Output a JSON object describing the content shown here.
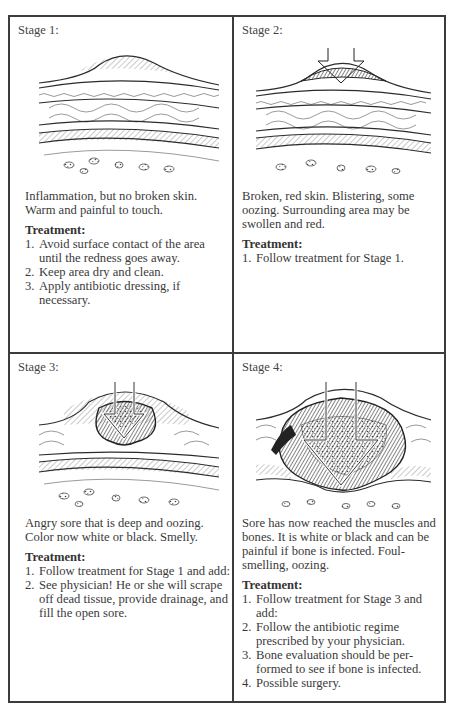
{
  "panels": [
    {
      "title": "Stage 1:",
      "illustration": "skin-cross-section-inflammation",
      "description": "Inflammation, but no broken skin. Warm and painful to touch.",
      "treatment_label": "Treatment:",
      "treatment": [
        {
          "num": "1.",
          "text": "Avoid surface contact of the area until the redness goes away."
        },
        {
          "num": "2.",
          "text": "Keep area dry and clean."
        },
        {
          "num": "3.",
          "text": "Apply antibiotic dressing, if necessary."
        }
      ]
    },
    {
      "title": "Stage 2:",
      "illustration": "skin-cross-section-blistering",
      "description": "Broken, red skin. Blistering, some oozing. Surrounding area may be swollen and red.",
      "treatment_label": "Treatment:",
      "treatment": [
        {
          "num": "1.",
          "text": "Follow treatment for Stage 1."
        }
      ]
    },
    {
      "title": "Stage 3:",
      "illustration": "skin-cross-section-deep-sore",
      "description": "Angry sore that is deep and oozing. Color now white or black. Smelly.",
      "treatment_label": "Treatment:",
      "treatment": [
        {
          "num": "1.",
          "text": "Follow treatment for Stage 1 and add:"
        },
        {
          "num": "2.",
          "text": "See physician! He or she will scrape off dead tissue, provide drainage, and fill the open sore."
        }
      ]
    },
    {
      "title": "Stage 4:",
      "illustration": "skin-cross-section-bone-muscle",
      "description": "Sore has now reached the muscles and bones. It is white or black and can be painful if bone is infected. Foul-smelling, oozing.",
      "treatment_label": "Treatment:",
      "treatment": [
        {
          "num": "1.",
          "text": "Follow treatment for Stage 3 and add:"
        },
        {
          "num": "2.",
          "text": "Follow the antibiotic regime prescribed by your physician."
        },
        {
          "num": "3.",
          "text": "Bone evaluation should be per-formed to see if bone is infected."
        },
        {
          "num": "4.",
          "text": "Possible surgery."
        }
      ]
    }
  ]
}
